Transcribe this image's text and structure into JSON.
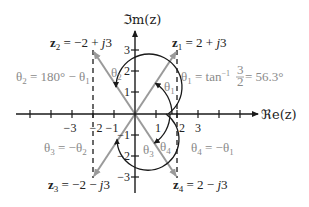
{
  "diagram": {
    "colors": {
      "axis": "#1a1a1a",
      "vector": "#9a9a9a",
      "arc": "#1a1a1a",
      "gray_label": "#8a8a8a",
      "text": "#222222"
    },
    "axes": {
      "real_label": "ℜe(z)",
      "imag_label": "ℑm(z)",
      "real_ticks": [
        "−3",
        "−2",
        "−1",
        "1",
        "2",
        "3"
      ],
      "imag_ticks": [
        "3",
        "2",
        "1",
        "−1",
        "−2",
        "−3"
      ]
    },
    "points": [
      {
        "id": "z1",
        "name": "z",
        "sub": "1",
        "expr": " = 2 + ",
        "j": "j",
        "tail": "3",
        "re": 2,
        "im": 3
      },
      {
        "id": "z2",
        "name": "z",
        "sub": "2",
        "expr": " = −2 + ",
        "j": "j",
        "tail": "3",
        "re": -2,
        "im": 3
      },
      {
        "id": "z3",
        "name": "z",
        "sub": "3",
        "expr": " = −2 − ",
        "j": "j",
        "tail": "3",
        "re": -2,
        "im": -3
      },
      {
        "id": "z4",
        "name": "z",
        "sub": "4",
        "expr": " = 2 − ",
        "j": "j",
        "tail": "3",
        "re": 2,
        "im": -3
      }
    ],
    "angle_labels": {
      "theta1_short": "θ",
      "theta1_sub": "1",
      "theta2_sub": "2",
      "theta3_sub": "3",
      "theta4_sub": "4"
    },
    "equations": {
      "theta1": {
        "lhs": "θ",
        "lhs_sub": "1",
        "mid": " = tan",
        "sup": "−1",
        "num": "3",
        "den": "2",
        "rhs": " = 56.3°"
      },
      "theta2": {
        "lhs": "θ",
        "lhs_sub": "2",
        "mid": " = 180° − θ",
        "rhs_sub": "1"
      },
      "theta3": {
        "lhs": "θ",
        "lhs_sub": "3",
        "mid": " = −θ",
        "rhs_sub": "2"
      },
      "theta4": {
        "lhs": "θ",
        "lhs_sub": "4",
        "mid": " = −θ",
        "rhs_sub": "1"
      }
    }
  }
}
